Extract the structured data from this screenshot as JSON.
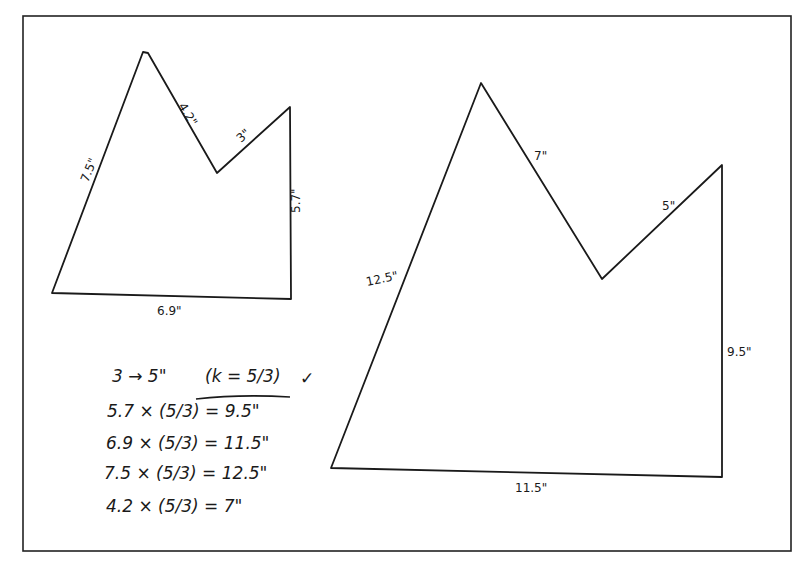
{
  "diagram": {
    "frame_color": "#222222",
    "line_color": "#1a1a1a",
    "original_shape": {
      "name": "small pentagon",
      "vertices": [
        [
          52,
          293
        ],
        [
          143,
          52
        ],
        [
          217,
          173
        ],
        [
          290,
          107
        ],
        [
          291,
          299
        ]
      ],
      "sides": {
        "left": "7.5\"",
        "top_right_slope": "4.2\"",
        "valley_to_right": "3\"",
        "right": "5.7\"",
        "bottom": "6.9\""
      }
    },
    "scaled_shape": {
      "name": "large pentagon",
      "vertices": [
        [
          331,
          468
        ],
        [
          481,
          83
        ],
        [
          602,
          279
        ],
        [
          722,
          165
        ],
        [
          722,
          477
        ]
      ],
      "sides": {
        "left": "12.5\"",
        "top_right_slope": "7\"",
        "valley_to_right": "5\"",
        "right": "9.5\"",
        "bottom": "11.5\""
      }
    },
    "work": {
      "line1": "3 → 5\"",
      "scale_factor": "(k = 5/3)",
      "mark": "✓",
      "calculations": [
        "5.7 × (5/3) = 9.5\"",
        "6.9 × (5/3) = 11.5\"",
        "7.5 × (5/3) = 12.5\"",
        "4.2 × (5/3) = 7\""
      ]
    }
  }
}
